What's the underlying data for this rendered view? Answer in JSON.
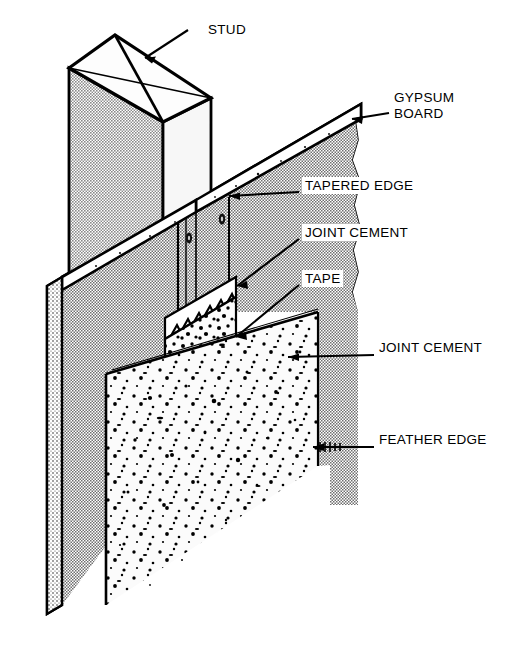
{
  "figure": {
    "kind": "technical-illustration",
    "background_color": "#ffffff",
    "line_color": "#000000",
    "stipple_gray": "#b9b9b9",
    "board_face_gray": "#c9c9c9",
    "cement_white": "#fbfbfb"
  },
  "labels": [
    {
      "id": "stud",
      "text": "STUD",
      "line2": ""
    },
    {
      "id": "gypsum-board",
      "text": "GYPSUM",
      "line2": "BOARD"
    },
    {
      "id": "tapered-edge",
      "text": "TAPERED EDGE",
      "line2": ""
    },
    {
      "id": "joint-cement-up",
      "text": "JOINT CEMENT",
      "line2": ""
    },
    {
      "id": "tape",
      "text": "TAPE",
      "line2": ""
    },
    {
      "id": "joint-cement-lo",
      "text": "JOINT CEMENT",
      "line2": ""
    },
    {
      "id": "feather-edge",
      "text": "FEATHER EDGE",
      "line2": ""
    }
  ],
  "parts": {
    "stud": "wood framing stud, square top shown with diagonal end-grain lines",
    "gypsum_board": "two gypsum wallboard panels meeting at a tapered joint",
    "tapered_edge": "factory recessed edge of the board",
    "tape": "paper joint tape bedded over the joint",
    "joint_cement": "joint compound bedding coat and finish coat",
    "feather_edge": "outer feathered boundary of the finish coat"
  }
}
